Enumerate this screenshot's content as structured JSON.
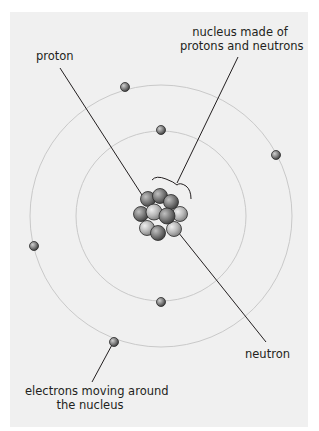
{
  "diagram": {
    "labels": {
      "nucleus": {
        "line1": "nucleus made of",
        "line2": "protons and neutrons"
      },
      "proton": "proton",
      "neutron": "neutron",
      "electrons": {
        "line1": "electrons moving around",
        "line2": "the nucleus"
      }
    },
    "shells": [
      {
        "name": "inner-shell",
        "cx": 161,
        "cy": 216,
        "r": 85
      },
      {
        "name": "outer-shell",
        "cx": 161,
        "cy": 216,
        "r": 131
      }
    ],
    "electrons": [
      {
        "shell": "outer",
        "x": 125,
        "y": 87
      },
      {
        "shell": "outer",
        "x": 276,
        "y": 155
      },
      {
        "shell": "outer",
        "x": 34,
        "y": 246
      },
      {
        "shell": "outer",
        "x": 114,
        "y": 342
      },
      {
        "shell": "inner",
        "x": 161,
        "y": 130
      },
      {
        "shell": "inner",
        "x": 161,
        "y": 302
      }
    ],
    "colors": {
      "background": "#f0f0f0",
      "shell": "#c8c8c8",
      "leader_line": "#231f20",
      "particle_dark": "#6e6e6e",
      "particle_light": "#b4b4b4"
    }
  }
}
